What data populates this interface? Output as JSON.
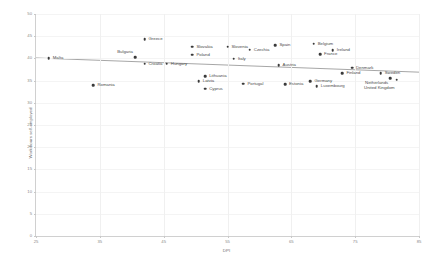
{
  "chart_data": {
    "type": "scatter",
    "title": "",
    "xlabel": "DPI",
    "ylabel": "Work hours self-employed",
    "xlim": [
      25,
      85
    ],
    "ylim": [
      0,
      50
    ],
    "xticks": [
      25,
      35,
      45,
      55,
      65,
      75,
      85
    ],
    "yticks": [
      0,
      5,
      10,
      15,
      20,
      25,
      30,
      35,
      40,
      45,
      50
    ],
    "grid": true,
    "legend": "none",
    "trendline": {
      "name": "linear fit",
      "x_start": 25,
      "y_start": 40.1,
      "x_end": 85,
      "y_end": 36.9,
      "color": "#808080"
    },
    "points": [
      {
        "label": "Malta",
        "x": 27.0,
        "y": 40.0,
        "label_dx": 4,
        "label_dy": 0
      },
      {
        "label": "Romania",
        "x": 34.0,
        "y": 34.0,
        "label_dx": 4,
        "label_dy": 0
      },
      {
        "label": "Bulgaria",
        "x": 40.5,
        "y": 40.3,
        "label_dx": -2,
        "label_dy": -5,
        "label_anchor": "end"
      },
      {
        "label": "Greece",
        "x": 42.0,
        "y": 44.3,
        "label_dx": 4,
        "label_dy": 0
      },
      {
        "label": "Croatia",
        "x": 42.0,
        "y": 38.8,
        "label_dx": 4,
        "label_dy": 0
      },
      {
        "label": "Hungary",
        "x": 45.5,
        "y": 38.8,
        "label_dx": 4,
        "label_dy": 0
      },
      {
        "label": "Slovakia",
        "x": 49.5,
        "y": 42.6,
        "label_dx": 4,
        "label_dy": 0
      },
      {
        "label": "Poland",
        "x": 49.5,
        "y": 40.8,
        "label_dx": 4,
        "label_dy": 0
      },
      {
        "label": "Lithuania",
        "x": 51.5,
        "y": 36.0,
        "label_dx": 4,
        "label_dy": 0
      },
      {
        "label": "Latvia",
        "x": 50.5,
        "y": 34.8,
        "label_dx": 4,
        "label_dy": 0
      },
      {
        "label": "Cyprus",
        "x": 51.5,
        "y": 33.2,
        "label_dx": 4,
        "label_dy": 0
      },
      {
        "label": "Slovenia",
        "x": 55.0,
        "y": 42.6,
        "label_dx": 4,
        "label_dy": 0
      },
      {
        "label": "Czechia",
        "x": 58.5,
        "y": 42.0,
        "label_dx": 4,
        "label_dy": 0
      },
      {
        "label": "Italy",
        "x": 56.0,
        "y": 39.9,
        "label_dx": 4,
        "label_dy": 0
      },
      {
        "label": "Portugal",
        "x": 57.5,
        "y": 34.3,
        "label_dx": 4,
        "label_dy": 0
      },
      {
        "label": "Spain",
        "x": 62.5,
        "y": 43.0,
        "label_dx": 4,
        "label_dy": 0
      },
      {
        "label": "Belgium",
        "x": 68.5,
        "y": 43.3,
        "label_dx": 4,
        "label_dy": 0
      },
      {
        "label": "Ireland",
        "x": 71.5,
        "y": 41.8,
        "label_dx": 4,
        "label_dy": 0
      },
      {
        "label": "France",
        "x": 69.5,
        "y": 41.0,
        "label_dx": 4,
        "label_dy": 0
      },
      {
        "label": "Austria",
        "x": 63.0,
        "y": 38.5,
        "label_dx": 4,
        "label_dy": 0
      },
      {
        "label": "Estonia",
        "x": 64.0,
        "y": 34.2,
        "label_dx": 4,
        "label_dy": 0
      },
      {
        "label": "Germany",
        "x": 68.0,
        "y": 34.8,
        "label_dx": 4,
        "label_dy": 0
      },
      {
        "label": "Luxembourg",
        "x": 69.0,
        "y": 33.8,
        "label_dx": 4,
        "label_dy": 0
      },
      {
        "label": "Denmark",
        "x": 74.5,
        "y": 37.9,
        "label_dx": 4,
        "label_dy": 0
      },
      {
        "label": "Finland",
        "x": 73.0,
        "y": 36.6,
        "label_dx": 4,
        "label_dy": 0
      },
      {
        "label": "Sweden",
        "x": 79.0,
        "y": 36.6,
        "label_dx": 4,
        "label_dy": 0
      },
      {
        "label": "Netherlands",
        "x": 80.5,
        "y": 35.6,
        "label_dx": -2,
        "label_dy": 5,
        "label_anchor": "end"
      },
      {
        "label": "United Kingdom",
        "x": 81.5,
        "y": 35.2,
        "label_dx": -2,
        "label_dy": 8,
        "label_anchor": "end"
      }
    ]
  }
}
